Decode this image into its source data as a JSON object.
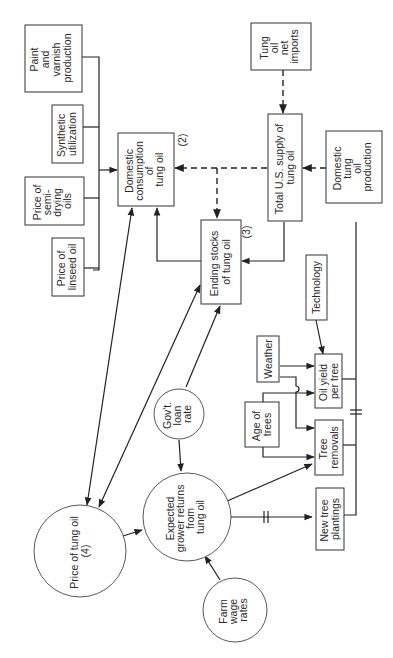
{
  "diagram": {
    "orientation": "rotated-90-ccw",
    "nodes": {
      "paint_varnish": {
        "shape": "box",
        "lines": [
          "Paint",
          "and",
          "varnish",
          "production"
        ]
      },
      "synthetic": {
        "shape": "box",
        "lines": [
          "Synthetic",
          "utilization"
        ]
      },
      "semi_drying": {
        "shape": "box",
        "lines": [
          "Price of",
          "semi-",
          "drying",
          "oils"
        ]
      },
      "linseed": {
        "shape": "box",
        "lines": [
          "Price of",
          "linseed oil"
        ]
      },
      "domestic_consumption": {
        "shape": "box",
        "lines": [
          "Domestic",
          "consumption",
          "of",
          "tung oil"
        ],
        "tag": "(2)"
      },
      "net_imports": {
        "shape": "box",
        "lines": [
          "Tung",
          "oil",
          "net",
          "imports"
        ]
      },
      "total_supply": {
        "shape": "box",
        "lines": [
          "Total U.S. supply of",
          "tung oil"
        ]
      },
      "domestic_production": {
        "shape": "box",
        "lines": [
          "Domestic",
          "tung",
          "oil",
          "production"
        ]
      },
      "ending_stocks": {
        "shape": "box",
        "lines": [
          "Ending stocks",
          "of tung oil"
        ],
        "tag": "(3)"
      },
      "technology": {
        "shape": "box",
        "lines": [
          "Technology"
        ]
      },
      "weather": {
        "shape": "box",
        "lines": [
          "Weather"
        ]
      },
      "oil_yield": {
        "shape": "box",
        "lines": [
          "Oil yield",
          "per tree"
        ]
      },
      "age_of_trees": {
        "shape": "box",
        "lines": [
          "Age of",
          "trees"
        ]
      },
      "tree_removals": {
        "shape": "box",
        "lines": [
          "Tree",
          "removals"
        ]
      },
      "new_plantings": {
        "shape": "box",
        "lines": [
          "New tree",
          "plantings"
        ]
      },
      "govt_loan_rate": {
        "shape": "circle",
        "lines": [
          "Gov't.",
          "loan",
          "rate"
        ]
      },
      "expected_returns": {
        "shape": "circle",
        "lines": [
          "Expected",
          "grower returns",
          "from",
          "tung oil"
        ]
      },
      "price_tung_oil": {
        "shape": "circle",
        "lines": [
          "Price of tung oil",
          "(4)"
        ]
      },
      "farm_wage": {
        "shape": "circle",
        "lines": [
          "Farm",
          "wage",
          "rates"
        ]
      }
    },
    "edges": [
      {
        "from": "paint_varnish",
        "to": "domestic_consumption",
        "style": "solid"
      },
      {
        "from": "synthetic",
        "to": "domestic_consumption",
        "style": "solid"
      },
      {
        "from": "semi_drying",
        "to": "domestic_consumption",
        "style": "solid"
      },
      {
        "from": "linseed",
        "to": "domestic_consumption",
        "style": "solid"
      },
      {
        "from": "net_imports",
        "to": "total_supply",
        "style": "dashed"
      },
      {
        "from": "domestic_production",
        "to": "total_supply",
        "style": "dashed"
      },
      {
        "from": "total_supply",
        "to": "domestic_consumption",
        "style": "dashed"
      },
      {
        "from": "total_supply",
        "to": "ending_stocks",
        "style": "dashed"
      },
      {
        "from": "total_supply",
        "to": "ending_stocks",
        "style": "solid"
      },
      {
        "from": "ending_stocks",
        "to": "domestic_consumption",
        "style": "solid"
      },
      {
        "from": "price_tung_oil",
        "to": "domestic_consumption",
        "style": "solid",
        "bidirectional": true
      },
      {
        "from": "price_tung_oil",
        "to": "ending_stocks",
        "style": "solid",
        "bidirectional": true
      },
      {
        "from": "govt_loan_rate",
        "to": "ending_stocks",
        "style": "solid"
      },
      {
        "from": "govt_loan_rate",
        "to": "expected_returns",
        "style": "solid"
      },
      {
        "from": "price_tung_oil",
        "to": "expected_returns",
        "style": "solid"
      },
      {
        "from": "farm_wage",
        "to": "expected_returns",
        "style": "solid"
      },
      {
        "from": "expected_returns",
        "to": "tree_removals",
        "style": "solid"
      },
      {
        "from": "expected_returns",
        "to": "new_plantings",
        "style": "solid",
        "lag": true
      },
      {
        "from": "technology",
        "to": "oil_yield",
        "style": "solid"
      },
      {
        "from": "weather",
        "to": "oil_yield",
        "style": "solid"
      },
      {
        "from": "weather",
        "to": "tree_removals",
        "style": "solid"
      },
      {
        "from": "age_of_trees",
        "to": "oil_yield",
        "style": "solid"
      },
      {
        "from": "age_of_trees",
        "to": "tree_removals",
        "style": "solid"
      },
      {
        "from": "oil_yield",
        "to": "domestic_production",
        "style": "solid"
      },
      {
        "from": "tree_removals",
        "to": "domestic_production",
        "style": "solid",
        "lag": true
      },
      {
        "from": "new_plantings",
        "to": "domestic_production",
        "style": "solid",
        "lag": true
      }
    ]
  }
}
